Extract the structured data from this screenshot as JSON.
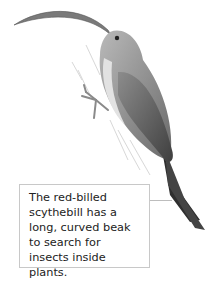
{
  "illustration": {
    "subject": "red-billed scythebill bird perched on branch"
  },
  "caption": {
    "text": "The red-billed scythebill has a long, curved beak to search for insects inside plants."
  }
}
